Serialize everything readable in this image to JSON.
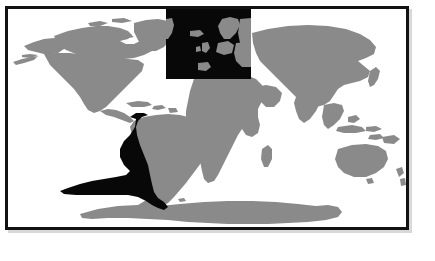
{
  "figure": {
    "kind": "world-map",
    "projection": "equirectangular",
    "background_color": "#ffffff",
    "land_color": "#8a8a8a",
    "highlight_color": "#080808",
    "frame_color": "#121212",
    "ocean_color": "#ffffff",
    "title": "",
    "caption": ""
  },
  "chart_data": {
    "type": "map",
    "title": "",
    "xlabel": "",
    "ylabel": "",
    "grid": false,
    "legend_position": "none",
    "projection": "equirectangular",
    "lon_range": [
      -180,
      180
    ],
    "lat_range": [
      -90,
      90
    ],
    "layers": [
      {
        "name": "landmasses",
        "color": "#8a8a8a",
        "description": "All continental land shown in mid gray"
      },
      {
        "name": "south-pacific-highlight",
        "color": "#080808",
        "description": "Dark crescent along the Pacific coast of South America widening westward near 30S-40S",
        "approx_lon_range": [
          -110,
          -64
        ],
        "approx_lat_range": [
          -55,
          12
        ]
      },
      {
        "name": "north-atlantic-europe-box",
        "color": "#080808",
        "description": "Dark rectangular overlay covering the North Atlantic and Europe",
        "approx_lon_range": [
          -37,
          40
        ],
        "approx_lat_range": [
          28,
          90
        ]
      }
    ],
    "regions": [
      {
        "name": "North America",
        "shade": "land"
      },
      {
        "name": "Greenland",
        "shade": "land"
      },
      {
        "name": "South America",
        "shade": "land"
      },
      {
        "name": "Africa",
        "shade": "land"
      },
      {
        "name": "Europe",
        "shade": "inside-dark-box"
      },
      {
        "name": "Asia",
        "shade": "land"
      },
      {
        "name": "Australia",
        "shade": "land"
      },
      {
        "name": "New Zealand",
        "shade": "land"
      },
      {
        "name": "Antarctica",
        "shade": "land"
      },
      {
        "name": "Madagascar",
        "shade": "land"
      },
      {
        "name": "Indonesia",
        "shade": "land"
      },
      {
        "name": "Japan",
        "shade": "land"
      },
      {
        "name": "Iceland",
        "shade": "inside-dark-box"
      },
      {
        "name": "British Isles",
        "shade": "inside-dark-box"
      },
      {
        "name": "Scandinavia",
        "shade": "inside-dark-box"
      }
    ]
  }
}
